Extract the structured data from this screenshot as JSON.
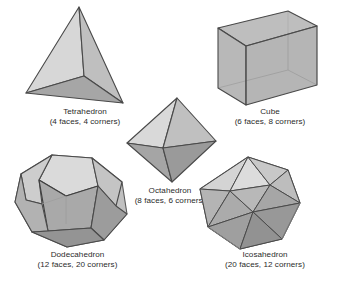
{
  "figure": {
    "background_color": "#ffffff",
    "title_present": false,
    "text_color": "#2b2b2b",
    "edge_color": "#4a4a4a",
    "palette": {
      "face_lightest": "#dcdcdc",
      "face_light": "#cfcfcf",
      "face_mid": "#bdbdbd",
      "face_dark": "#a2a2a2",
      "face_darkest": "#8d8d8d",
      "edge": "#4a4a4a",
      "edge_hidden": "#9a9a9a"
    },
    "solids": [
      {
        "id": "tetrahedron",
        "name": "Tetrahedron",
        "counts": "(4 faces, 4 corners)",
        "faces": 4,
        "corners": 4,
        "edges": 6,
        "face_shape": "triangle",
        "position": "top-left"
      },
      {
        "id": "cube",
        "name": "Cube",
        "counts": "(6 faces, 8 corners)",
        "faces": 6,
        "corners": 8,
        "edges": 12,
        "face_shape": "square",
        "position": "top-right"
      },
      {
        "id": "octahedron",
        "name": "Octahedron",
        "counts": "(8 faces, 6 corners)",
        "faces": 8,
        "corners": 6,
        "edges": 12,
        "face_shape": "triangle",
        "position": "center"
      },
      {
        "id": "dodecahedron",
        "name": "Dodecahedron",
        "counts": "(12 faces, 20 corners)",
        "faces": 12,
        "corners": 20,
        "edges": 30,
        "face_shape": "pentagon",
        "position": "bottom-left"
      },
      {
        "id": "icosahedron",
        "name": "Icosahedron",
        "counts": "(20 faces, 12 corners)",
        "faces": 20,
        "corners": 12,
        "edges": 30,
        "face_shape": "triangle",
        "position": "bottom-right"
      }
    ]
  }
}
